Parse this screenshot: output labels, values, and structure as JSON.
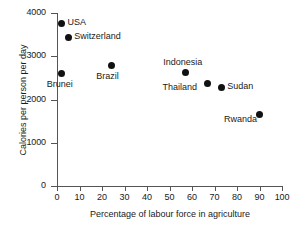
{
  "chart_data": {
    "type": "scatter",
    "title": "",
    "xlabel": "Percentage of labour force in agriculture",
    "ylabel": "Calories per person per day",
    "xlim": [
      0,
      100
    ],
    "ylim": [
      0,
      4000
    ],
    "xticks": [
      "0",
      "10",
      "20",
      "30",
      "40",
      "50",
      "60",
      "70",
      "80",
      "90",
      "100"
    ],
    "yticks": [
      "0",
      "1000",
      "2000",
      "3000",
      "4000"
    ],
    "grid": false,
    "legend": false,
    "marker_color": "#111111",
    "axis_color": "#555555",
    "points": [
      {
        "label": "USA",
        "x": 2,
        "y": 3750,
        "label_pos": "right"
      },
      {
        "label": "Switzerland",
        "x": 5,
        "y": 3430,
        "label_pos": "right"
      },
      {
        "label": "Brunei",
        "x": 2,
        "y": 2600,
        "label_pos": "below"
      },
      {
        "label": "Brazil",
        "x": 24,
        "y": 2780,
        "label_pos": "below"
      },
      {
        "label": "Indonesia",
        "x": 57,
        "y": 2620,
        "label_pos": "above"
      },
      {
        "label": "Thailand",
        "x": 67,
        "y": 2370,
        "label_pos": "left"
      },
      {
        "label": "Sudan",
        "x": 73,
        "y": 2270,
        "label_pos": "right"
      },
      {
        "label": "Rwanda",
        "x": 90,
        "y": 1650,
        "label_pos": "left"
      }
    ]
  }
}
